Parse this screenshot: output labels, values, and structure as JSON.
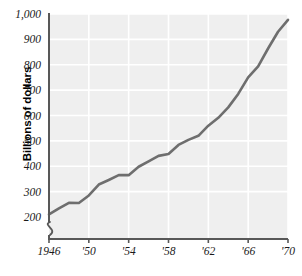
{
  "chart_data": {
    "type": "line",
    "title": "",
    "subtitle": "",
    "xlabel": "",
    "ylabel": "Billions of dollars",
    "xlim": [
      1946,
      1970
    ],
    "ylim": [
      180,
      1000
    ],
    "y_axis_break": true,
    "y_axis_break_below": 200,
    "grid": true,
    "legend": "none",
    "line_color": "#6e6e6e",
    "plot_background": "#efefef",
    "gridline_color": "#ffffff",
    "axis_color": "#585858",
    "y_ticks": [
      200,
      300,
      400,
      500,
      600,
      700,
      800,
      900,
      1000
    ],
    "y_tick_labels": [
      "200",
      "300",
      "400",
      "500",
      "600",
      "700",
      "800",
      "900",
      "1,000"
    ],
    "x_ticks": [
      1946,
      1950,
      1954,
      1958,
      1962,
      1966,
      1970
    ],
    "x_tick_labels": [
      "1946",
      "'50",
      "'54",
      "'58",
      "'62",
      "'66",
      "'70"
    ],
    "x": [
      1946,
      1947,
      1948,
      1949,
      1950,
      1951,
      1952,
      1953,
      1954,
      1955,
      1956,
      1957,
      1958,
      1959,
      1960,
      1961,
      1962,
      1963,
      1964,
      1965,
      1966,
      1967,
      1968,
      1969,
      1970
    ],
    "values": [
      210,
      234,
      256,
      255,
      285,
      328,
      346,
      365,
      365,
      398,
      419,
      441,
      448,
      484,
      504,
      520,
      560,
      591,
      632,
      685,
      750,
      794,
      864,
      930,
      977
    ],
    "series": [
      {
        "name": "Gross national product",
        "values": [
          210,
          234,
          256,
          255,
          285,
          328,
          346,
          365,
          365,
          398,
          419,
          441,
          448,
          484,
          504,
          520,
          560,
          591,
          632,
          685,
          750,
          794,
          864,
          930,
          977
        ]
      }
    ]
  },
  "axis": {
    "y_title": "Billions of dollars"
  }
}
